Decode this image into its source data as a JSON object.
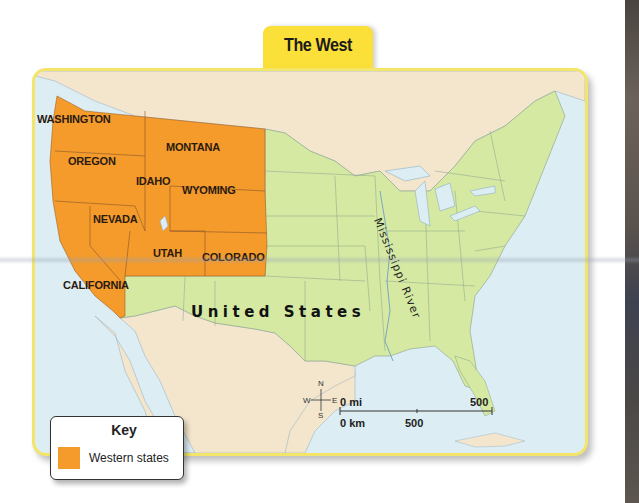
{
  "title": "The West",
  "map": {
    "country_label": "United States",
    "river_label": "Mississippi River",
    "states": [
      {
        "name": "WASHINGTON",
        "highlighted": true
      },
      {
        "name": "OREGON",
        "highlighted": true
      },
      {
        "name": "CALIFORNIA",
        "highlighted": true
      },
      {
        "name": "IDAHO",
        "highlighted": true
      },
      {
        "name": "NEVADA",
        "highlighted": true
      },
      {
        "name": "MONTANA",
        "highlighted": true
      },
      {
        "name": "WYOMING",
        "highlighted": true
      },
      {
        "name": "UTAH",
        "highlighted": true
      },
      {
        "name": "COLORADO",
        "highlighted": true
      }
    ],
    "compass": {
      "n": "N",
      "s": "S",
      "e": "E",
      "w": "W"
    },
    "scale": {
      "mi_start": "0 mi",
      "mi_end": "500",
      "km_start": "0 km",
      "km_mid": "500"
    },
    "colors": {
      "western_states": "#f49b2c",
      "other_states": "#d5e9a3",
      "foreign_land": "#f4e6cc",
      "water": "#dcedf3",
      "frame": "#f3e56a",
      "title_tab": "#fbe03a"
    }
  },
  "key": {
    "title": "Key",
    "items": [
      {
        "label": "Western states",
        "color": "#f49b2c"
      }
    ]
  }
}
